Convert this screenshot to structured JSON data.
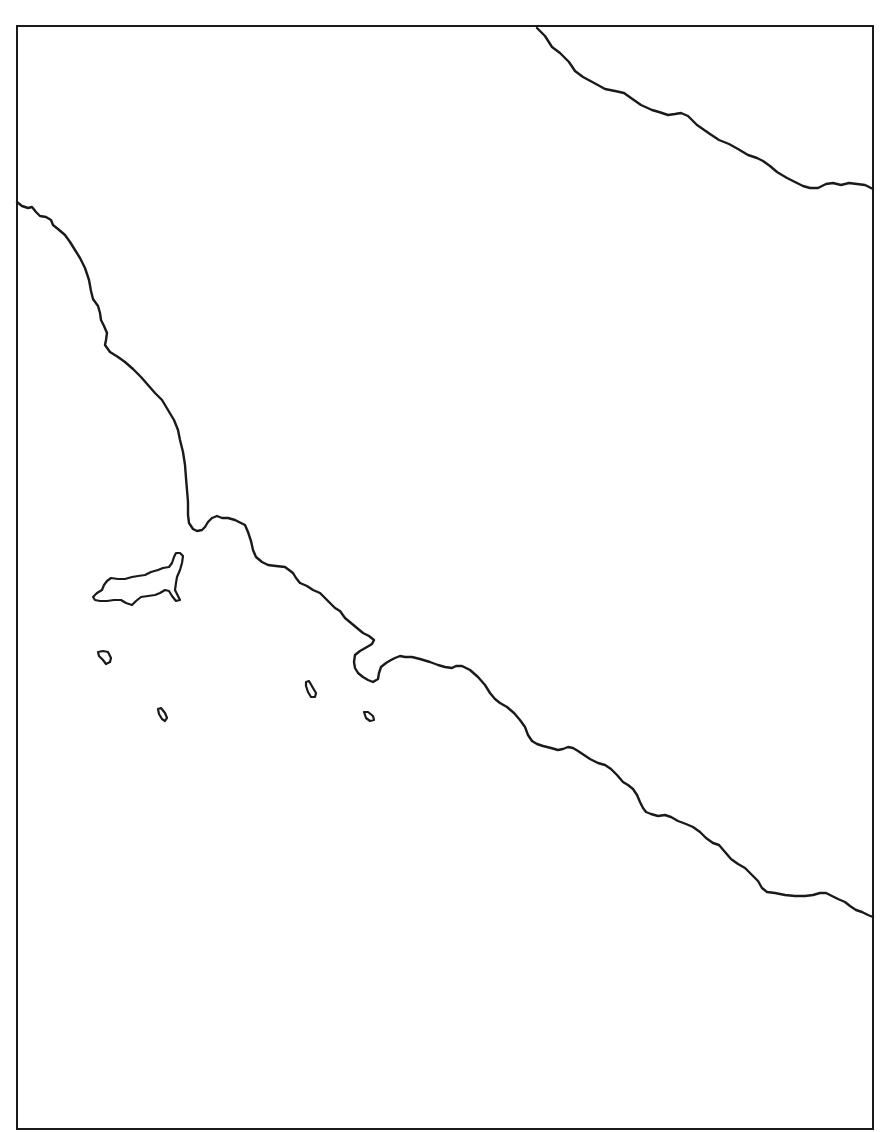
{
  "map": {
    "type": "blank outline map",
    "labels": [],
    "colors": {
      "background": "#ffffff",
      "line": "#1a1a1a"
    },
    "frame": {
      "left": 16,
      "top": 25,
      "right": 874,
      "bottom": 1130
    },
    "features": [
      {
        "id": "northeast-coastline",
        "kind": "coastline"
      },
      {
        "id": "main-coastline",
        "kind": "coastline"
      },
      {
        "id": "large-island",
        "kind": "island"
      },
      {
        "id": "small-island-1",
        "kind": "island"
      },
      {
        "id": "small-island-2",
        "kind": "island"
      },
      {
        "id": "small-island-3",
        "kind": "island"
      },
      {
        "id": "small-island-4",
        "kind": "island"
      }
    ]
  }
}
